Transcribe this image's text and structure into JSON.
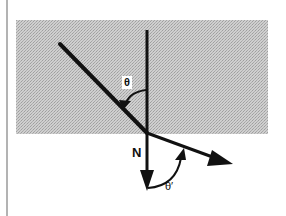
{
  "diagram": {
    "type": "ray-optics-refraction",
    "labels": {
      "incident_angle": "θ",
      "normal": "N",
      "refracted_angle": "θ′"
    },
    "colors": {
      "background": "#ffffff",
      "medium_fill": "#c8c8c8",
      "medium_dots": "#a8a8a8",
      "stroke": "#111111",
      "border": "#9a9a9a"
    },
    "elements": {
      "medium_region": {
        "x": 16,
        "y": 20,
        "width": 252,
        "height": 114
      },
      "normal_line": {
        "x1": 147,
        "y1": 30,
        "x2": 147,
        "y2": 190
      },
      "incident_ray": {
        "x1": 60,
        "y1": 44,
        "x2": 147,
        "y2": 133
      },
      "refracted_ray": {
        "x1": 147,
        "y1": 133,
        "x2": 232,
        "y2": 164
      }
    }
  }
}
